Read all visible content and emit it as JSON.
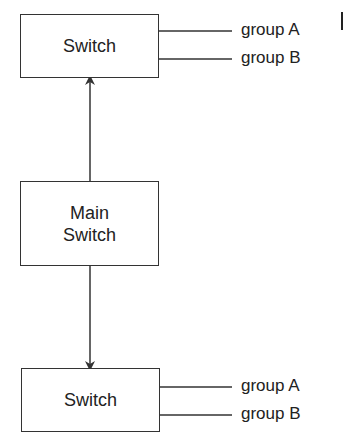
{
  "diagram": {
    "top_switch": {
      "label": "Switch",
      "outputs": [
        "group A",
        "group B"
      ]
    },
    "main_switch": {
      "label_line1": "Main",
      "label_line2": "Switch"
    },
    "bottom_switch": {
      "label": "Switch",
      "outputs": [
        "group A",
        "group B"
      ]
    },
    "edges": [
      {
        "from": "main_switch",
        "to": "top_switch",
        "arrow": true
      },
      {
        "from": "main_switch",
        "to": "bottom_switch",
        "arrow": true
      }
    ],
    "colors": {
      "line": "#333333",
      "text": "#222222",
      "background": "#ffffff"
    }
  }
}
